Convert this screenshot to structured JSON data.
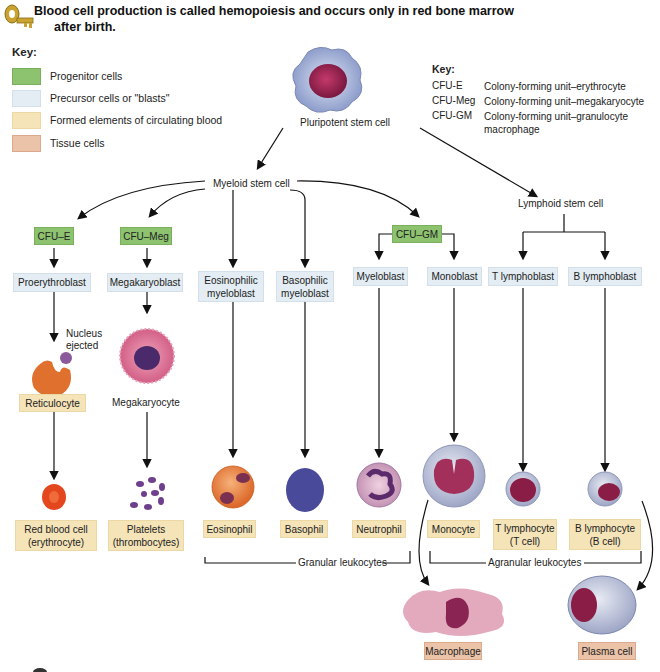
{
  "header": {
    "line1": "Blood cell production is called hemopoiesis and occurs only in red bone marrow",
    "line2": "after birth.",
    "icon": "key-icon"
  },
  "legend": {
    "title": "Key:",
    "items": [
      {
        "label": "Progenitor cells",
        "color": "#8dc26f"
      },
      {
        "label": "Precursor cells or \"blasts\"",
        "color": "#e3edf3"
      },
      {
        "label": "Formed elements of circulating blood",
        "color": "#f5e4b8"
      },
      {
        "label": "Tissue cells",
        "color": "#ebc3a8"
      }
    ]
  },
  "abbreviations": {
    "title": "Key:",
    "items": [
      {
        "abbr": "CFU-E",
        "meaning": "Colony-forming unit–erythrocyte"
      },
      {
        "abbr": "CFU-Meg",
        "meaning": "Colony-forming unit–megakaryocyte"
      },
      {
        "abbr": "CFU-GM",
        "meaning": "Colony-forming unit–granulocyte macrophage"
      }
    ]
  },
  "stem": {
    "pluripotent": "Pluripotent stem cell",
    "myeloid": "Myeloid stem cell",
    "lymphoid": "Lymphoid stem cell"
  },
  "progenitors": {
    "cfu_e": "CFU–E",
    "cfu_meg": "CFU–Meg",
    "cfu_gm": "CFU–GM"
  },
  "precursors": {
    "proerythroblast": "Proerythroblast",
    "megakaryoblast": "Megakaryoblast",
    "eosinophilic": "Eosinophilic myeloblast",
    "basophilic": "Basophilic myeloblast",
    "myeloblast": "Myeloblast",
    "monoblast": "Monoblast",
    "t_lymphoblast": "T lymphoblast",
    "b_lymphoblast": "B lymphoblast"
  },
  "intermediate": {
    "nucleus_ejected": "Nucleus ejected",
    "reticulocyte": "Reticulocyte",
    "megakaryocyte": "Megakaryocyte"
  },
  "formed": {
    "rbc": "Red blood cell (erythrocyte)",
    "platelets": "Platelets (thrombocytes)",
    "eosinophil": "Eosinophil",
    "basophil": "Basophil",
    "neutrophil": "Neutrophil",
    "monocyte": "Monocyte",
    "t_lymphocyte": "T lymphocyte (T cell)",
    "b_lymphocyte": "B lymphocyte (B cell)"
  },
  "groups": {
    "granular": "Granular leukocytes",
    "agranular": "Agranular leukocytes"
  },
  "tissue": {
    "macrophage": "Macrophage",
    "plasma": "Plasma cell"
  }
}
